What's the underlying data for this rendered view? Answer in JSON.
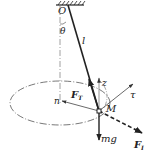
{
  "diagram": {
    "type": "conical-pendulum-force-diagram",
    "colors": {
      "line": "#222222",
      "axis": "#777777",
      "ellipse": "#555555",
      "background": "#ffffff"
    },
    "labels": {
      "pivot": "O",
      "angle": "θ",
      "length": "l",
      "tension": "F",
      "tension_sub": "T",
      "vertical_axis": "z",
      "tangent_axis": "τ",
      "normal_axis": "n",
      "mass_point": "M",
      "gravity": "mg",
      "inertial_force": "F",
      "inertial_sub": "I"
    },
    "elements": {
      "ceiling": "hatched-support",
      "string": "solid-line",
      "axis": "dash-dot-vertical",
      "path": "dash-dot-ellipse",
      "inertial_force_style": "dashed-arrow"
    }
  }
}
